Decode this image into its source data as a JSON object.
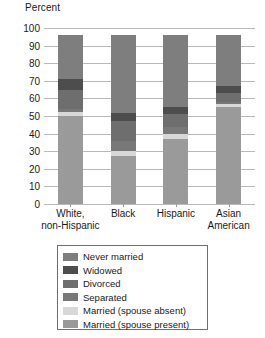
{
  "axis_title": "Percent",
  "chart_data": {
    "type": "bar",
    "subtype": "stacked-vertical-percent",
    "title": "",
    "xlabel": "",
    "ylabel": "Percent",
    "ylim": [
      0,
      100
    ],
    "yticks": [
      0,
      10,
      20,
      30,
      40,
      50,
      60,
      70,
      80,
      90,
      100
    ],
    "ytick_labels": [
      "0",
      "10",
      "20",
      "30",
      "40",
      "50",
      "60",
      "70",
      "80",
      "90",
      "100"
    ],
    "grid": true,
    "legend_position": "below-plot",
    "categories": [
      "White, non-Hispanic",
      "Black",
      "Hispanic",
      "Asian American"
    ],
    "category_lines": [
      [
        "White,",
        "non-Hispanic"
      ],
      [
        "Black"
      ],
      [
        "Hispanic"
      ],
      [
        "Asian",
        "American"
      ]
    ],
    "stack_order_bottom_to_top": [
      "Married (spouse present)",
      "Married (spouse absent)",
      "Separated",
      "Divorced",
      "Widowed",
      "Never married"
    ],
    "series": [
      {
        "name": "Married (spouse present)",
        "color": "#9a9a9a",
        "values": [
          50,
          27,
          37,
          55
        ]
      },
      {
        "name": "Married (spouse absent)",
        "color": "#d8d8d8",
        "values": [
          2,
          3,
          3,
          2
        ]
      },
      {
        "name": "Separated",
        "color": "#787878",
        "values": [
          2,
          6,
          4,
          1
        ]
      },
      {
        "name": "Divorced",
        "color": "#6e6e6e",
        "values": [
          11,
          11,
          7,
          5
        ]
      },
      {
        "name": "Widowed",
        "color": "#4d4d4d",
        "values": [
          6,
          5,
          4,
          4
        ]
      },
      {
        "name": "Never married",
        "color": "#7e7e7e",
        "values": [
          25,
          44,
          41,
          29
        ]
      }
    ]
  },
  "legend": {
    "entries": [
      {
        "label": "Never married",
        "color": "#7e7e7e"
      },
      {
        "label": "Widowed",
        "color": "#4d4d4d"
      },
      {
        "label": "Divorced",
        "color": "#6e6e6e"
      },
      {
        "label": "Separated",
        "color": "#787878"
      },
      {
        "label": "Married (spouse absent)",
        "color": "#d8d8d8"
      },
      {
        "label": "Married (spouse present)",
        "color": "#9a9a9a"
      }
    ]
  }
}
